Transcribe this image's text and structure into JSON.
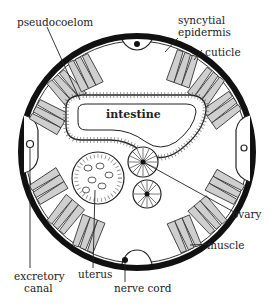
{
  "diagram": {
    "type": "cross-section",
    "labels": {
      "pseudocoelom": "pseudocoelom",
      "syncytial_epidermis_1": "syncytial",
      "syncytial_epidermis_2": "epidermis",
      "cuticle": "cuticle",
      "intestine": "intestine",
      "ovary": "ovary",
      "muscle": "muscle",
      "excretory_canal_1": "excretory",
      "excretory_canal_2": "canal",
      "uterus": "uterus",
      "nerve_cord": "nerve cord"
    },
    "colors": {
      "outline": "#111111",
      "muscle_fill": "#cfcfcf",
      "background": "#ffffff"
    }
  }
}
